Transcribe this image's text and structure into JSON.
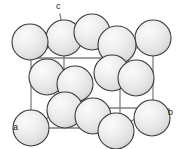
{
  "figure": {
    "kind": "crystal-unit-cell-diagram",
    "background_color": "#ffffff",
    "sphere_fill": "#ebebeb",
    "sphere_highlight": "#f8f8f8",
    "sphere_shadow": "#cfcfcf",
    "sphere_outline": "#3a3a3a",
    "cell_edge_color": "#808080",
    "label_color": "#1a1a1a"
  },
  "axis_labels": [
    {
      "id": "a",
      "text": "a",
      "x": 13,
      "y": 123
    },
    {
      "id": "b",
      "text": "b",
      "x": 168,
      "y": 108
    },
    {
      "id": "c",
      "text": "c",
      "x": 56,
      "y": 2
    }
  ],
  "cell_vertices": {
    "front_bottom_left": {
      "x": 31,
      "y": 128
    },
    "front_bottom_right": {
      "x": 120,
      "y": 128
    },
    "front_top_left": {
      "x": 31,
      "y": 58
    },
    "front_top_right": {
      "x": 120,
      "y": 58
    },
    "back_bottom_left": {
      "x": 64,
      "y": 108
    },
    "back_bottom_right": {
      "x": 153,
      "y": 108
    },
    "back_top_left": {
      "x": 64,
      "y": 38
    },
    "back_top_right": {
      "x": 153,
      "y": 38
    }
  },
  "spheres": [
    {
      "id": "corner-back-top-left",
      "x": 64,
      "y": 38,
      "r": 18,
      "role": "corner"
    },
    {
      "id": "face-top",
      "x": 92,
      "y": 32,
      "r": 18,
      "role": "face-center"
    },
    {
      "id": "corner-back-top-right",
      "x": 153,
      "y": 38,
      "r": 18,
      "role": "corner"
    },
    {
      "id": "corner-front-top-left",
      "x": 30,
      "y": 42,
      "r": 18,
      "role": "corner"
    },
    {
      "id": "face-back",
      "x": 117,
      "y": 45,
      "r": 19,
      "role": "face-center"
    },
    {
      "id": "face-left",
      "x": 47,
      "y": 77,
      "r": 18,
      "role": "face-center"
    },
    {
      "id": "face-front",
      "x": 75,
      "y": 84,
      "r": 18,
      "role": "face-center"
    },
    {
      "id": "face-right",
      "x": 136,
      "y": 78,
      "r": 18,
      "role": "face-center"
    },
    {
      "id": "corner-front-top-right",
      "x": 112,
      "y": 73,
      "r": 18,
      "role": "corner"
    },
    {
      "id": "corner-back-bottom-left",
      "x": 65,
      "y": 110,
      "r": 18,
      "role": "corner"
    },
    {
      "id": "face-bottom",
      "x": 93,
      "y": 116,
      "r": 18,
      "role": "face-center"
    },
    {
      "id": "corner-back-bottom-right",
      "x": 152,
      "y": 118,
      "r": 18,
      "role": "corner"
    },
    {
      "id": "corner-front-bottom-left",
      "x": 31,
      "y": 128,
      "r": 18,
      "role": "corner"
    },
    {
      "id": "corner-front-bottom-mid",
      "x": 116,
      "y": 131,
      "r": 18,
      "role": "corner"
    }
  ]
}
